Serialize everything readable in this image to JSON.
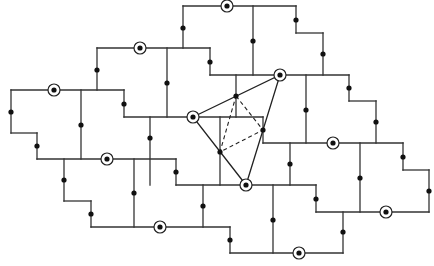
{
  "diagram": {
    "width": 434,
    "height": 266,
    "colors": {
      "line": "#333333",
      "dot": "#111111",
      "background": "#ffffff"
    },
    "boundary_and_cell_edges": [
      [
        [
          183,
          6
        ],
        [
          296,
          6
        ]
      ],
      [
        [
          183,
          6
        ],
        [
          183,
          48
        ]
      ],
      [
        [
          253,
          6
        ],
        [
          253,
          75
        ]
      ],
      [
        [
          296,
          6
        ],
        [
          296,
          33
        ]
      ],
      [
        [
          296,
          33
        ],
        [
          323,
          33
        ]
      ],
      [
        [
          323,
          33
        ],
        [
          323,
          75
        ]
      ],
      [
        [
          97,
          48
        ],
        [
          210,
          48
        ]
      ],
      [
        [
          97,
          48
        ],
        [
          97,
          90
        ]
      ],
      [
        [
          167,
          48
        ],
        [
          167,
          117
        ]
      ],
      [
        [
          210,
          48
        ],
        [
          210,
          75
        ]
      ],
      [
        [
          210,
          75
        ],
        [
          349,
          75
        ]
      ],
      [
        [
          11,
          90
        ],
        [
          124,
          90
        ]
      ],
      [
        [
          11,
          90
        ],
        [
          11,
          133
        ]
      ],
      [
        [
          81,
          90
        ],
        [
          81,
          159
        ]
      ],
      [
        [
          124,
          90
        ],
        [
          124,
          117
        ]
      ],
      [
        [
          124,
          117
        ],
        [
          263,
          117
        ]
      ],
      [
        [
          236,
          75
        ],
        [
          236,
          117
        ]
      ],
      [
        [
          306,
          75
        ],
        [
          306,
          143
        ]
      ],
      [
        [
          349,
          75
        ],
        [
          349,
          101
        ]
      ],
      [
        [
          349,
          101
        ],
        [
          376,
          101
        ]
      ],
      [
        [
          376,
          101
        ],
        [
          376,
          143
        ]
      ],
      [
        [
          263,
          117
        ],
        [
          263,
          143
        ]
      ],
      [
        [
          263,
          143
        ],
        [
          403,
          143
        ]
      ],
      [
        [
          11,
          133
        ],
        [
          37,
          133
        ]
      ],
      [
        [
          37,
          133
        ],
        [
          37,
          159
        ]
      ],
      [
        [
          37,
          159
        ],
        [
          176,
          159
        ]
      ],
      [
        [
          150,
          117
        ],
        [
          150,
          185
        ]
      ],
      [
        [
          220,
          117
        ],
        [
          220,
          185
        ]
      ],
      [
        [
          290,
          143
        ],
        [
          290,
          185
        ]
      ],
      [
        [
          360,
          143
        ],
        [
          360,
          212
        ]
      ],
      [
        [
          403,
          143
        ],
        [
          403,
          170
        ]
      ],
      [
        [
          403,
          170
        ],
        [
          429,
          170
        ]
      ],
      [
        [
          429,
          170
        ],
        [
          429,
          212
        ]
      ],
      [
        [
          64,
          159
        ],
        [
          64,
          201
        ]
      ],
      [
        [
          64,
          201
        ],
        [
          91,
          201
        ]
      ],
      [
        [
          91,
          201
        ],
        [
          91,
          227
        ]
      ],
      [
        [
          134,
          159
        ],
        [
          134,
          227
        ]
      ],
      [
        [
          176,
          159
        ],
        [
          176,
          185
        ]
      ],
      [
        [
          176,
          185
        ],
        [
          316,
          185
        ]
      ],
      [
        [
          273,
          185
        ],
        [
          273,
          253
        ]
      ],
      [
        [
          316,
          185
        ],
        [
          316,
          212
        ]
      ],
      [
        [
          316,
          212
        ],
        [
          429,
          212
        ]
      ],
      [
        [
          91,
          227
        ],
        [
          230,
          227
        ]
      ],
      [
        [
          203,
          185
        ],
        [
          203,
          227
        ]
      ],
      [
        [
          230,
          227
        ],
        [
          230,
          253
        ]
      ],
      [
        [
          230,
          253
        ],
        [
          343,
          253
        ]
      ],
      [
        [
          343,
          212
        ],
        [
          343,
          253
        ]
      ]
    ],
    "edge_midpoints": [
      [
        183,
        28
      ],
      [
        253,
        41
      ],
      [
        296,
        20
      ],
      [
        323,
        54
      ],
      [
        97,
        70
      ],
      [
        167,
        83
      ],
      [
        210,
        62
      ],
      [
        11,
        112
      ],
      [
        81,
        125
      ],
      [
        124,
        104
      ],
      [
        306,
        110
      ],
      [
        349,
        88
      ],
      [
        376,
        122
      ],
      [
        37,
        146
      ],
      [
        150,
        138
      ],
      [
        220,
        152
      ],
      [
        290,
        164
      ],
      [
        360,
        178
      ],
      [
        403,
        157
      ],
      [
        429,
        191
      ],
      [
        64,
        180
      ],
      [
        91,
        214
      ],
      [
        134,
        193
      ],
      [
        176,
        172
      ],
      [
        203,
        206
      ],
      [
        230,
        240
      ],
      [
        273,
        220
      ],
      [
        316,
        199
      ],
      [
        343,
        232
      ],
      [
        236,
        96
      ],
      [
        263,
        130
      ]
    ],
    "circled_nodes": [
      [
        227,
        6
      ],
      [
        140,
        48
      ],
      [
        54,
        90
      ],
      [
        193,
        117
      ],
      [
        280,
        75
      ],
      [
        333,
        143
      ],
      [
        107,
        159
      ],
      [
        246,
        185
      ],
      [
        386,
        212
      ],
      [
        160,
        227
      ],
      [
        299,
        253
      ]
    ],
    "triangle": [
      [
        193,
        117
      ],
      [
        280,
        75
      ],
      [
        246,
        185
      ]
    ],
    "dashed_triangle": [
      [
        236,
        96
      ],
      [
        263,
        130
      ],
      [
        220,
        152
      ]
    ]
  }
}
